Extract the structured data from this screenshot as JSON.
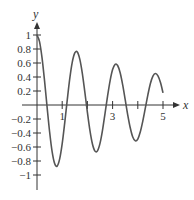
{
  "chart_data": {
    "type": "line",
    "title": "",
    "xlabel": "x",
    "ylabel": "y",
    "xlim": [
      0,
      5.6
    ],
    "ylim": [
      -1.2,
      1.1
    ],
    "grid": false,
    "legend": null,
    "x_ticks": [
      1,
      2,
      3,
      4,
      5
    ],
    "x_tick_labels": [
      "1",
      "",
      "3",
      "",
      "5"
    ],
    "y_ticks": [
      1,
      0.8,
      0.6,
      0.4,
      0.2,
      -0.2,
      -0.4,
      -0.6,
      -0.8,
      -1
    ],
    "y_tick_labels": [
      "1",
      "0.8",
      "0.6",
      "0.4",
      "0.2",
      "−0.2",
      "−0.4",
      "−0.6",
      "−0.8",
      "−1"
    ],
    "series": [
      {
        "name": "damped oscillation",
        "color": "#555555",
        "x": [
          0,
          0.1,
          0.2,
          0.3,
          0.4,
          0.5,
          0.6,
          0.7,
          0.8,
          0.9,
          1.0,
          1.1,
          1.2,
          1.3,
          1.4,
          1.5,
          1.6,
          1.7,
          1.8,
          1.9,
          2.0,
          2.1,
          2.2,
          2.3,
          2.4,
          2.5,
          2.6,
          2.7,
          2.8,
          2.9,
          3.0,
          3.1,
          3.2,
          3.3,
          3.4,
          3.5,
          3.6,
          3.7,
          3.8,
          3.9,
          4.0,
          4.1,
          4.2,
          4.3,
          4.4,
          4.5,
          4.6,
          4.7,
          4.8,
          4.9,
          5.0
        ],
        "y": [
          1,
          0.906,
          0.674,
          0.344,
          -0.027,
          -0.382,
          -0.666,
          -0.836,
          -0.872,
          -0.77,
          -0.552,
          -0.255,
          0.071,
          0.376,
          0.612,
          0.744,
          0.757,
          0.651,
          0.448,
          0.179,
          -0.104,
          -0.363,
          -0.558,
          -0.659,
          -0.655,
          -0.549,
          -0.359,
          -0.118,
          0.128,
          0.346,
          0.506,
          0.582,
          0.564,
          0.46,
          0.287,
          0.076,
          -0.14,
          -0.325,
          -0.457,
          -0.512,
          -0.486,
          -0.383,
          -0.226,
          -0.041,
          0.145,
          0.307,
          0.412,
          0.449,
          0.416,
          0.32,
          0.174
        ]
      }
    ],
    "layout": {
      "origin_px": [
        37,
        105
      ],
      "x_unit_px": 25.2,
      "y_unit_px": 70,
      "x_axis_end_px": 180,
      "y_axis_top_px": 22,
      "y_axis_bottom_px": 190,
      "axis_color": "#333333"
    }
  }
}
